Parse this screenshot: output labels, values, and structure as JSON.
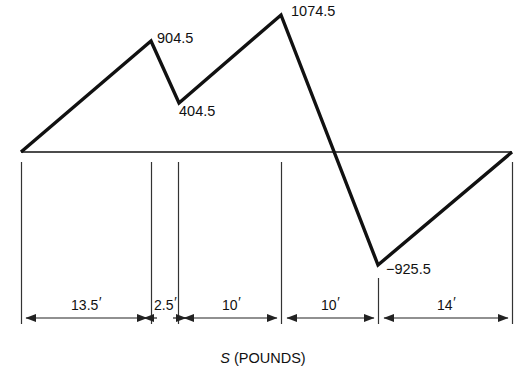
{
  "figure": {
    "caption_symbol": "S",
    "caption_units": "(POUNDS)",
    "baseline_y": 152,
    "origin_x": 21,
    "end_x": 512
  },
  "chart_data": {
    "type": "line",
    "title": "",
    "subtitle": "",
    "xlabel": "S (POUNDS)",
    "ylabel": "",
    "grid": false,
    "legend": null,
    "axis_note": "Shear force diagram; horizontal baseline is zero shear",
    "x_units": "feet",
    "y_units": "pounds",
    "segment_lengths": [
      13.5,
      2.5,
      10,
      10,
      14
    ],
    "segment_labels": [
      "13.5'",
      "2.5'",
      "10'",
      "10'",
      "14'"
    ],
    "x_stations": [
      0,
      13.5,
      16,
      26,
      36,
      50
    ],
    "value_labels": [
      "904.5",
      "404.5",
      "1074.5",
      "-925.5"
    ],
    "values": [
      0,
      904.5,
      404.5,
      1074.5,
      -925.5,
      0
    ],
    "points": [
      {
        "x": 0,
        "y": 0,
        "label": "",
        "px": 21,
        "py": 152
      },
      {
        "x": 13.5,
        "y": 904.5,
        "label": "904.5",
        "px": 151,
        "py": 41
      },
      {
        "x": 16,
        "y": 404.5,
        "label": "404.5",
        "px": 179,
        "py": 103
      },
      {
        "x": 26,
        "y": 1074.5,
        "label": "1074.5",
        "px": 281,
        "py": 15
      },
      {
        "x": 36,
        "y": -925.5,
        "label": "−925.5",
        "px": 378,
        "py": 265
      },
      {
        "x": 50,
        "y": 0,
        "label": "",
        "px": 512,
        "py": 152
      }
    ]
  },
  "annotations": {
    "peak1": "904.5",
    "valley1": "404.5",
    "peak2": "1074.5",
    "valley2": "−925.5"
  },
  "dimensions": [
    {
      "label": "13.5",
      "unit": "′",
      "from_px": 21,
      "to_px": 151
    },
    {
      "label": "2.5",
      "unit": "′",
      "from_px": 151,
      "to_px": 178
    },
    {
      "label": "10",
      "unit": "′",
      "from_px": 178,
      "to_px": 281
    },
    {
      "label": "10",
      "unit": "′",
      "from_px": 281,
      "to_px": 378
    },
    {
      "label": "14",
      "unit": "′",
      "from_px": 378,
      "to_px": 513
    }
  ],
  "colors": {
    "line": "#111111",
    "baseline": "#111111",
    "dimension": "#333333",
    "background": "#ffffff"
  }
}
